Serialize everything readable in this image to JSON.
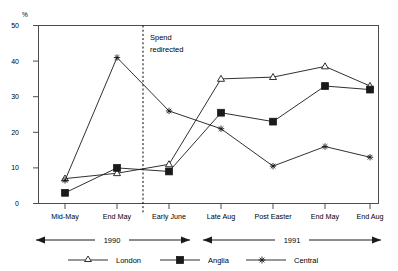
{
  "chart_data": {
    "type": "line",
    "title": "",
    "subtitle": "",
    "xlabel": "",
    "ylabel": "%",
    "ylim": [
      0,
      50
    ],
    "yticks": [
      0,
      10,
      20,
      30,
      40,
      50
    ],
    "grid": false,
    "legend_position": "bottom",
    "categories": [
      "Mid-May",
      "End May",
      "Early June",
      "Late Aug",
      "Post Easter",
      "End May",
      "End Aug"
    ],
    "series": [
      {
        "name": "London",
        "marker": "open-triangle",
        "values": [
          7,
          8.5,
          11,
          35,
          35.5,
          38.5,
          33
        ]
      },
      {
        "name": "Anglia",
        "marker": "filled-square",
        "values": [
          3,
          10,
          9,
          25.5,
          23,
          33,
          32
        ]
      },
      {
        "name": "Central",
        "marker": "star",
        "values": [
          6.5,
          41,
          26,
          21,
          10.5,
          16,
          13
        ]
      }
    ],
    "annotations": [
      {
        "text_line1": "Spend",
        "text_line2": "redirected",
        "at_category_boundary": "between End May and Early June"
      }
    ],
    "period_bands": [
      {
        "label": "1990",
        "from": "Mid-May",
        "to": "Early June"
      },
      {
        "label": "1991",
        "from": "Late Aug",
        "to": "End Aug"
      }
    ]
  },
  "axis": {
    "y_unit": "%",
    "y_tick_labels": [
      "50",
      "40",
      "30",
      "20",
      "10",
      "0"
    ],
    "x_tick_labels": [
      "Mid-May",
      "End May",
      "Early June",
      "Late Aug",
      "Post Easter",
      "End May",
      "End Aug"
    ]
  },
  "annotation": {
    "line1": "Spend",
    "line2": "redirected"
  },
  "periods": {
    "first": "1990",
    "second": "1991"
  },
  "legend": {
    "items": [
      {
        "label": "London",
        "marker": "open-triangle-marker"
      },
      {
        "label": "Anglia",
        "marker": "filled-square-marker"
      },
      {
        "label": "Central",
        "marker": "star-marker"
      }
    ]
  },
  "colors": {
    "line": "#1a1a1a",
    "frame": "#4d4d4d",
    "background": "#ffffff"
  }
}
